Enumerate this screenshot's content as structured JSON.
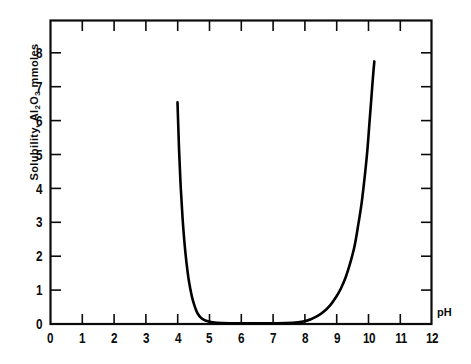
{
  "chart_data": {
    "type": "line",
    "title": "",
    "xlabel": "pH",
    "ylabel": "Solubility, Al2O3  mmoles",
    "ylabel_parts": {
      "prefix": "Solubility, Al",
      "sub1": "2",
      "mid": "O",
      "sub2": "3",
      "suffix": "  mmoles"
    },
    "xlim": [
      0,
      12
    ],
    "ylim": [
      0,
      8.9
    ],
    "xticks": [
      "0",
      "1",
      "2",
      "3",
      "4",
      "5",
      "6",
      "7",
      "8",
      "9",
      "10",
      "11",
      "12"
    ],
    "yticks": [
      "0",
      "1",
      "2",
      "3",
      "4",
      "5",
      "6",
      "7",
      "8"
    ],
    "grid": false,
    "legend": null,
    "frame": "box-with-inward-ticks",
    "line_color": "#000000",
    "background_color": "#ffffff",
    "series": [
      {
        "name": "Al2O3 solubility vs pH",
        "x": [
          4.0,
          4.05,
          4.1,
          4.16,
          4.22,
          4.28,
          4.34,
          4.4,
          4.46,
          4.52,
          4.58,
          4.64,
          4.72,
          4.82,
          4.95,
          5.1,
          5.4,
          6.0,
          6.8,
          7.4,
          7.8,
          8.0,
          8.2,
          8.4,
          8.6,
          8.8,
          9.0,
          9.15,
          9.3,
          9.45,
          9.58,
          9.7,
          9.8,
          9.9,
          9.98,
          10.05,
          10.1,
          10.14,
          10.17,
          10.19,
          10.2
        ],
        "y": [
          6.5,
          5.1,
          4.05,
          3.1,
          2.38,
          1.82,
          1.38,
          1.05,
          0.78,
          0.58,
          0.42,
          0.3,
          0.2,
          0.13,
          0.08,
          0.05,
          0.03,
          0.02,
          0.02,
          0.03,
          0.05,
          0.08,
          0.14,
          0.23,
          0.36,
          0.54,
          0.8,
          1.05,
          1.38,
          1.82,
          2.3,
          2.95,
          3.55,
          4.35,
          5.1,
          5.95,
          6.55,
          7.05,
          7.4,
          7.6,
          7.7
        ]
      }
    ],
    "annotations": {
      "left_branch_start": {
        "x": 4.0,
        "y": 6.5
      },
      "right_branch_end": {
        "x": 10.2,
        "y": 7.7
      },
      "minimum_region": {
        "x_start": 4.9,
        "x_end": 7.4,
        "y": 0.02
      }
    }
  }
}
